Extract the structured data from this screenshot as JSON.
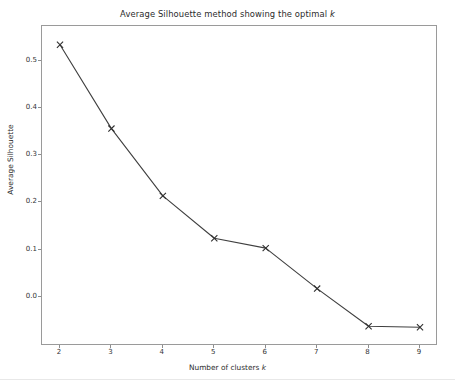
{
  "figure": {
    "background_color": "#ffffff",
    "axes_edge_color": "#9a9a9a",
    "line_color": "#3f3f3f",
    "text_color": "#2b2b2b"
  },
  "chart_data": {
    "type": "line",
    "title_prefix": "Average Silhouette method showing the optimal ",
    "title_italic": "k",
    "title": "Average Silhouette method showing the optimal k",
    "xlabel_prefix": "Number of clusters ",
    "xlabel_italic": "k",
    "xlabel": "Number of clusters k",
    "ylabel": "Average Silhouette",
    "x": [
      2,
      3,
      4,
      5,
      6,
      7,
      8,
      9
    ],
    "values": [
      0.535,
      0.357,
      0.214,
      0.124,
      0.103,
      0.017,
      -0.063,
      -0.065
    ],
    "xtick_labels": [
      "2",
      "3",
      "4",
      "5",
      "6",
      "7",
      "8",
      "9"
    ],
    "ytick_labels": [
      "0.0",
      "0.1",
      "0.2",
      "0.3",
      "0.4",
      "0.5"
    ],
    "ytick_values": [
      0.0,
      0.1,
      0.2,
      0.3,
      0.4,
      0.5
    ],
    "xlim": [
      1.65,
      9.35
    ],
    "ylim": [
      -0.105,
      0.575
    ],
    "grid": false,
    "legend": null,
    "marker": "x",
    "linewidth": 1.0,
    "marker_color": "#2f2f2f"
  }
}
